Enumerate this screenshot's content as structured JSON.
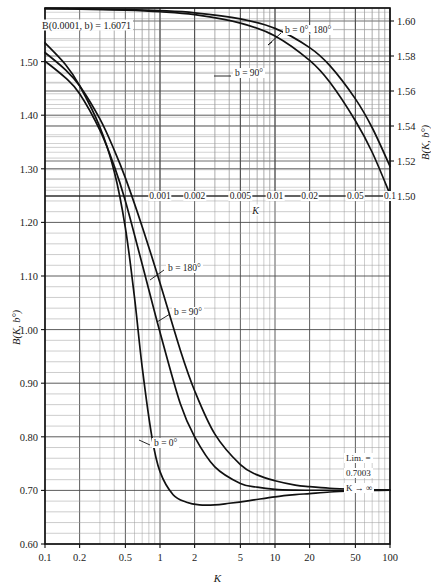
{
  "chart_data": {
    "type": "line",
    "title": "",
    "xlabel": "K",
    "ylabel": "B(K, b°)",
    "xscale": "log",
    "xlim": [
      0.1,
      100
    ],
    "ylim": [
      0.6,
      1.6
    ],
    "grid": true,
    "legend": "inline-annotations",
    "primary_axis": {
      "x_ticks": [
        "0.1",
        "0.2",
        "0.5",
        "1",
        "2",
        "5",
        "10",
        "20",
        "50",
        "100"
      ],
      "x_tick_values": [
        0.1,
        0.2,
        0.5,
        1,
        2,
        5,
        10,
        20,
        50,
        100
      ],
      "y_ticks": [
        "0.60",
        "0.70",
        "0.80",
        "0.90",
        "1.00",
        "1.10",
        "1.20",
        "1.30",
        "1.40",
        "1.50"
      ],
      "y_tick_values": [
        0.6,
        0.7,
        0.8,
        0.9,
        1.0,
        1.1,
        1.2,
        1.3,
        1.4,
        1.5
      ],
      "xlabel": "K",
      "ylabel": "B(K, b°)"
    },
    "secondary_axis": {
      "x_ticks": [
        "0.001",
        "0.002",
        "0.005",
        "0.01",
        "0.02",
        "0.05",
        "0.1"
      ],
      "x_tick_values": [
        0.001,
        0.002,
        0.005,
        0.01,
        0.02,
        0.05,
        0.1
      ],
      "y_ticks": [
        "1.50",
        "1.52",
        "1.54",
        "1.56",
        "1.58",
        "1.60"
      ],
      "y_tick_values": [
        1.5,
        1.52,
        1.54,
        1.56,
        1.58,
        1.6
      ],
      "xlabel": "K",
      "ylabel": "B(K, b°)"
    },
    "annotations": [
      {
        "name": "top-left-value",
        "text": "B(0.0001, b) = 1.6071"
      },
      {
        "name": "upper-curve-label-0-180",
        "text": "b = 0°, 180°"
      },
      {
        "name": "upper-curve-label-90",
        "text": "b = 90°"
      },
      {
        "name": "lower-curve-label-180",
        "text": "b = 180°"
      },
      {
        "name": "lower-curve-label-90",
        "text": "b = 90°"
      },
      {
        "name": "lower-curve-label-0",
        "text": "b = 0°"
      },
      {
        "name": "limit-line-1",
        "text": "Lim. ="
      },
      {
        "name": "limit-line-2",
        "text": "0.7003"
      },
      {
        "name": "limit-line-3",
        "text": "K → ∞"
      }
    ],
    "series": [
      {
        "name": "b = 0°, 180° (upper inset)",
        "axis": "secondary",
        "x": [
          0.0001,
          0.0002,
          0.0005,
          0.001,
          0.002,
          0.005,
          0.01,
          0.02,
          0.03,
          0.05,
          0.07,
          0.1
        ],
        "y": [
          1.6071,
          1.6069,
          1.6065,
          1.6059,
          1.6047,
          1.6012,
          1.5958,
          1.5848,
          1.5745,
          1.5555,
          1.539,
          1.517
        ]
      },
      {
        "name": "b = 90° (upper inset)",
        "axis": "secondary",
        "x": [
          0.0001,
          0.0002,
          0.0005,
          0.001,
          0.002,
          0.005,
          0.01,
          0.02,
          0.03,
          0.05,
          0.07,
          0.1
        ],
        "y": [
          1.6071,
          1.6068,
          1.6062,
          1.6053,
          1.6036,
          1.5988,
          1.5915,
          1.5775,
          1.565,
          1.543,
          1.525,
          1.501
        ]
      },
      {
        "name": "b = 180°",
        "axis": "primary",
        "x": [
          0.1,
          0.15,
          0.2,
          0.3,
          0.4,
          0.5,
          0.7,
          1.0,
          1.5,
          2.0,
          3.0,
          5.0,
          7.0,
          10,
          15,
          20,
          30,
          50,
          70,
          100
        ],
        "y": [
          1.517,
          1.485,
          1.455,
          1.393,
          1.335,
          1.283,
          1.192,
          1.087,
          0.962,
          0.886,
          0.805,
          0.748,
          0.729,
          0.718,
          0.71,
          0.707,
          0.704,
          0.702,
          0.7012,
          0.7005
        ]
      },
      {
        "name": "b = 90°",
        "axis": "primary",
        "x": [
          0.1,
          0.15,
          0.2,
          0.3,
          0.4,
          0.5,
          0.7,
          1.0,
          1.5,
          2.0,
          3.0,
          5.0,
          7.0,
          10,
          15,
          20,
          30,
          50,
          70,
          100
        ],
        "y": [
          1.501,
          1.47,
          1.44,
          1.372,
          1.305,
          1.24,
          1.122,
          0.995,
          0.862,
          0.8,
          0.744,
          0.713,
          0.706,
          0.702,
          0.7005,
          0.7003,
          0.7003,
          0.7003,
          0.7003,
          0.7003
        ]
      },
      {
        "name": "b = 0°",
        "axis": "primary",
        "x": [
          0.1,
          0.15,
          0.2,
          0.3,
          0.4,
          0.5,
          0.6,
          0.7,
          0.85,
          1.0,
          1.3,
          1.7,
          2.2,
          3.0,
          4.0,
          6.0,
          10,
          15,
          20,
          30,
          50,
          70,
          100
        ],
        "y": [
          1.535,
          1.495,
          1.455,
          1.378,
          1.295,
          1.19,
          1.06,
          0.93,
          0.8,
          0.735,
          0.692,
          0.678,
          0.673,
          0.673,
          0.676,
          0.681,
          0.688,
          0.692,
          0.694,
          0.697,
          0.699,
          0.6998,
          0.7003
        ]
      }
    ],
    "limit_value": 0.7003,
    "colors": {
      "curve": "#111111",
      "grid_minor": "#9a9a9a",
      "grid_major": "#4a4a4a",
      "frame": "#111111",
      "background": "#ffffff"
    }
  }
}
